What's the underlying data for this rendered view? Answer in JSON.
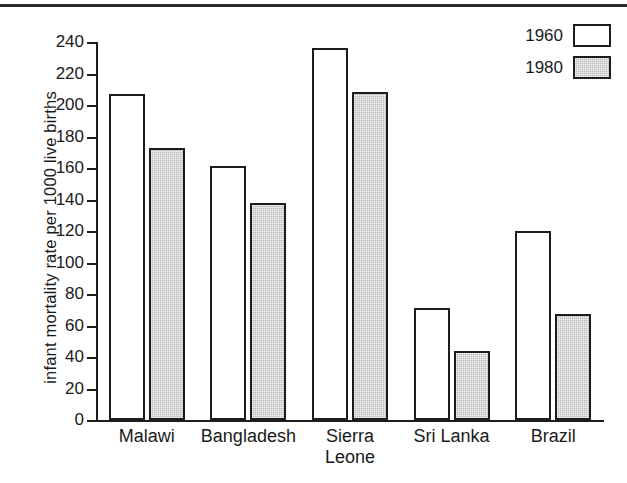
{
  "chart_data": {
    "type": "bar",
    "title": "",
    "xlabel": "",
    "ylabel": "infant mortality rate per 1000 live births",
    "ylim": [
      0,
      240
    ],
    "ytick_step": 20,
    "yticks": [
      "240",
      "220",
      "200",
      "180",
      "160",
      "140",
      "120",
      "100",
      "80",
      "60",
      "40",
      "20",
      "0"
    ],
    "grid": false,
    "legend_position": "top-right",
    "categories": [
      "Malawi",
      "Bangladesh",
      "Sierra\nLeone",
      "Sri Lanka",
      "Brazil"
    ],
    "series": [
      {
        "name": "1960",
        "values": [
          207,
          161,
          236,
          71,
          120
        ]
      },
      {
        "name": "1980",
        "values": [
          173,
          138,
          208,
          44,
          67
        ]
      }
    ]
  },
  "legend": {
    "entries": [
      {
        "label": "1960",
        "swatch": "white"
      },
      {
        "label": "1980",
        "swatch": "gray"
      }
    ]
  },
  "colors": {
    "series_1960": "#ffffff",
    "series_1980": "#b9b9b9",
    "ink": "#1c1c1c",
    "background": "#ffffff"
  }
}
